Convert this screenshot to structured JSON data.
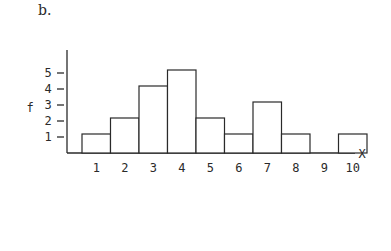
{
  "panel_label": "b.",
  "chart_data": {
    "type": "bar",
    "title": "",
    "xlabel": "X",
    "ylabel": "f",
    "categories": [
      "1",
      "2",
      "3",
      "4",
      "5",
      "6",
      "7",
      "8",
      "9",
      "10"
    ],
    "values": [
      1,
      2,
      4,
      5,
      2,
      1,
      3,
      1,
      0,
      1
    ],
    "yticks": [
      "1",
      "2",
      "3",
      "4",
      "5"
    ],
    "ylim": [
      0,
      6
    ],
    "grid": false,
    "legend": null
  }
}
